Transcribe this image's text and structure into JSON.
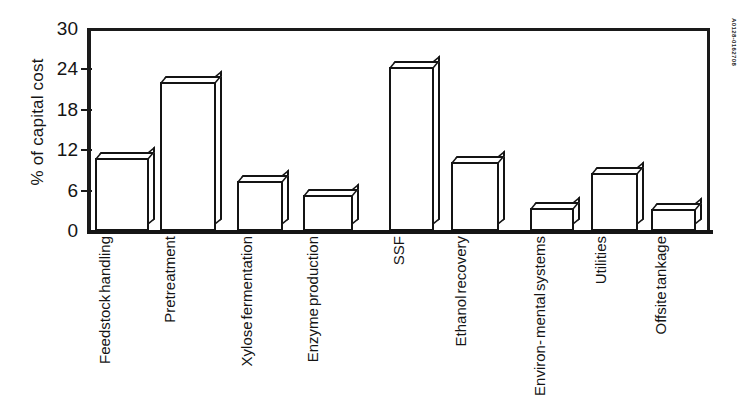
{
  "figure": {
    "id_text": "A0128-0162708"
  },
  "chart_data": {
    "type": "bar",
    "title": "",
    "xlabel": "",
    "ylabel": "% of capital cost",
    "ylim": [
      0,
      30
    ],
    "yticks": [
      0,
      6,
      12,
      18,
      24,
      30
    ],
    "grid": false,
    "legend": null,
    "style": "3d-outline-bars",
    "categories": [
      "Feedstock handling",
      "Pretreatment",
      "Xylose fermentation",
      "Enzyme production",
      "SSF",
      "Ethanol recovery",
      "Environ- mental systems",
      "Utilities",
      "Offsite tankage"
    ],
    "category_lines": [
      [
        "Feedstock",
        "handling"
      ],
      [
        "Pretreatment"
      ],
      [
        "Xylose",
        "fermentation"
      ],
      [
        "Enzyme",
        "production"
      ],
      [
        "SSF"
      ],
      [
        "Ethanol",
        "recovery"
      ],
      [
        "Environ-",
        "mental",
        "systems"
      ],
      [
        "Utilities"
      ],
      [
        "Offsite",
        "tankage"
      ]
    ],
    "values": [
      10.8,
      22.2,
      7.4,
      5.3,
      24.3,
      10.3,
      3.4,
      8.6,
      3.3
    ]
  },
  "axis": {
    "tick_labels": [
      "30",
      "24",
      "18",
      "12",
      "6",
      "0"
    ]
  },
  "colors": {
    "ink": "#141414",
    "background": "#ffffff"
  }
}
